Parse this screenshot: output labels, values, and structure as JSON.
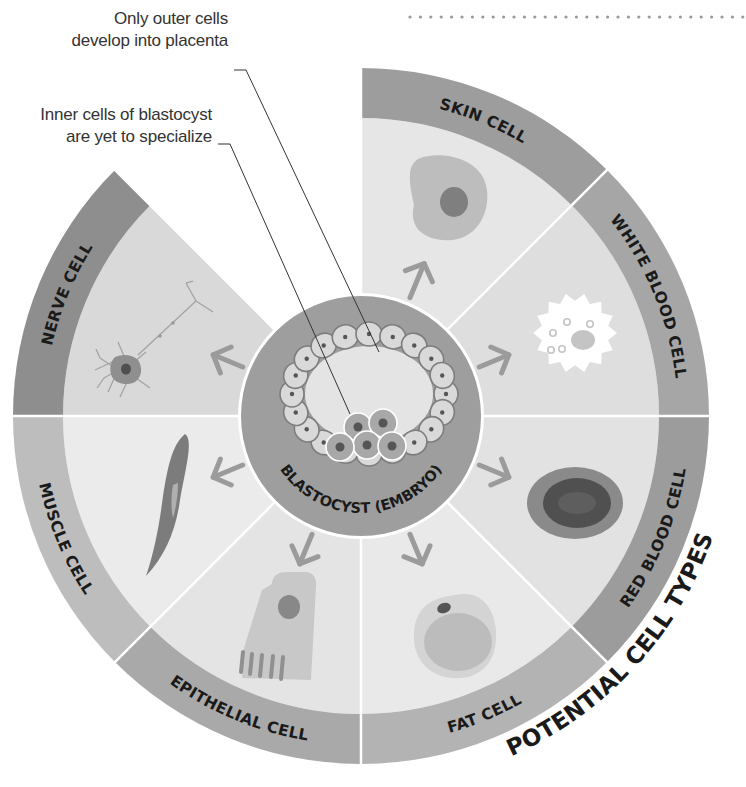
{
  "title": "POTENTIAL CELL TYPES",
  "center": {
    "label": "BLASTOCYST (EMBRYO)",
    "fill": "#9e9e9e"
  },
  "callouts": [
    {
      "lines": [
        "Only outer cells",
        "develop into placenta"
      ]
    },
    {
      "lines": [
        "Inner cells of blastocyst",
        "are yet to specialize"
      ]
    }
  ],
  "segments": [
    {
      "id": "skin",
      "label": "SKIN CELL",
      "start": 45,
      "end": 90,
      "ring_color": "#9d9d9d",
      "fill_color": "#e6e6e6",
      "label_side": "top"
    },
    {
      "id": "white-blood",
      "label": "WHITE BLOOD CELL",
      "start": 0,
      "end": 45,
      "ring_color": "#a6a6a6",
      "fill_color": "#dedede",
      "label_side": "top"
    },
    {
      "id": "red-blood",
      "label": "RED BLOOD CELL",
      "start": -45,
      "end": 0,
      "ring_color": "#9c9c9c",
      "fill_color": "#e2e2e2",
      "label_side": "bottom"
    },
    {
      "id": "fat",
      "label": "FAT CELL",
      "start": -90,
      "end": -45,
      "ring_color": "#b3b3b3",
      "fill_color": "#e9e9e9",
      "label_side": "bottom"
    },
    {
      "id": "epithelial",
      "label": "EPITHELIAL CELL",
      "start": -135,
      "end": -90,
      "ring_color": "#a9a9a9",
      "fill_color": "#e4e4e4",
      "label_side": "bottom"
    },
    {
      "id": "muscle",
      "label": "MUSCLE CELL",
      "start": -180,
      "end": -135,
      "ring_color": "#bdbdbd",
      "fill_color": "#ebebeb",
      "label_side": "bottom"
    },
    {
      "id": "nerve",
      "label": "NERVE CELL",
      "start": 135,
      "end": 180,
      "ring_color": "#8e8e8e",
      "fill_color": "#d9d9d9",
      "label_side": "top"
    }
  ],
  "decor": {
    "dotted_rule": true
  }
}
